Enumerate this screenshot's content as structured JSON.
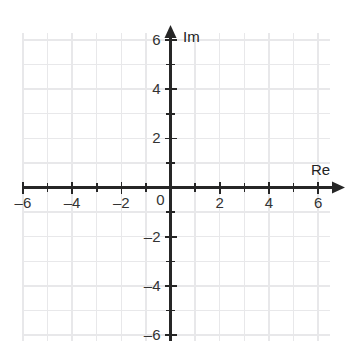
{
  "chart_data": {
    "type": "scatter",
    "title": "",
    "subtitle": "",
    "xlabel": "Re",
    "ylabel": "Im",
    "xlim": [
      -6.6,
      6.6
    ],
    "ylim": [
      -6.6,
      6.6
    ],
    "xticks": [
      -6,
      -5,
      -4,
      -3,
      -2,
      -1,
      0,
      1,
      2,
      3,
      4,
      5,
      6
    ],
    "yticks": [
      -6,
      -5,
      -4,
      -3,
      -2,
      -1,
      0,
      1,
      2,
      3,
      4,
      5,
      6
    ],
    "xtick_labels": [
      "–6",
      "",
      "–4",
      "",
      "–2",
      "",
      "0",
      "",
      "2",
      "",
      "4",
      "",
      "6"
    ],
    "ytick_labels": [
      "–6",
      "",
      "–4",
      "",
      "–2",
      "",
      "",
      "",
      "2",
      "",
      "4",
      "",
      "6"
    ],
    "grid": true,
    "grid_step": 1,
    "legend": null,
    "series": [],
    "annotations": [],
    "origin_label": "0"
  },
  "axes": {
    "real_axis_label": "Re",
    "imaginary_axis_label": "Im",
    "origin_label": "0",
    "arrowheads": [
      "right",
      "up"
    ]
  },
  "colors": {
    "background": "#ffffff",
    "grid": "#e8e8ea",
    "axis": "#262626",
    "tick_text": "#333333",
    "label_text": "#222222"
  },
  "x_tick_labels": [
    {
      "value": -6,
      "text": "–6"
    },
    {
      "value": -4,
      "text": "–4"
    },
    {
      "value": -2,
      "text": "–2"
    },
    {
      "value": 0,
      "text": "0"
    },
    {
      "value": 2,
      "text": "2"
    },
    {
      "value": 4,
      "text": "4"
    },
    {
      "value": 6,
      "text": "6"
    }
  ],
  "y_tick_labels": [
    {
      "value": 6,
      "text": "6"
    },
    {
      "value": 4,
      "text": "4"
    },
    {
      "value": 2,
      "text": "2"
    },
    {
      "value": -2,
      "text": "–2"
    },
    {
      "value": -4,
      "text": "–4"
    },
    {
      "value": -6,
      "text": "–6"
    }
  ]
}
